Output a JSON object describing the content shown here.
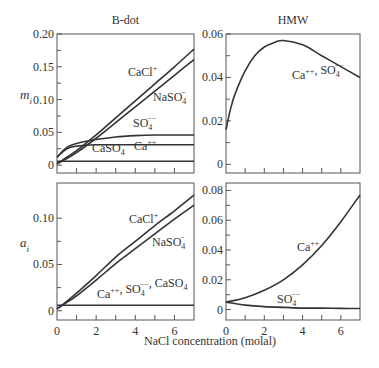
{
  "figure": {
    "column_titles": [
      "B-dot",
      "HMW"
    ],
    "row_ylabels": [
      "m_i",
      "a_i"
    ],
    "xlabel": "NaCl concentration (molal)"
  },
  "chart_data": [
    {
      "type": "line",
      "panel": "top-left",
      "title": "B-dot",
      "ylabel": "m_i",
      "xlabel": "",
      "xlim": [
        0,
        7
      ],
      "ylim": [
        -0.012,
        0.2
      ],
      "yticks": [
        0,
        0.05,
        0.1,
        0.15,
        0.2
      ],
      "ytick_labels": [
        "0",
        "0.05",
        "0.10",
        "0.15",
        "0.20"
      ],
      "x": [
        0,
        0.5,
        1,
        2,
        3,
        4,
        5,
        6,
        7
      ],
      "series": [
        {
          "name": "CaCl+",
          "values": [
            0.002,
            0.012,
            0.022,
            0.046,
            0.072,
            0.098,
            0.124,
            0.15,
            0.177
          ]
        },
        {
          "name": "NaSO4-",
          "values": [
            0.002,
            0.01,
            0.019,
            0.041,
            0.065,
            0.089,
            0.113,
            0.137,
            0.161
          ]
        },
        {
          "name": "SO4--",
          "values": [
            0.012,
            0.027,
            0.033,
            0.039,
            0.043,
            0.045,
            0.046,
            0.046,
            0.046
          ]
        },
        {
          "name": "Ca++",
          "values": [
            0.012,
            0.025,
            0.029,
            0.031,
            0.031,
            0.031,
            0.031,
            0.031,
            0.031
          ]
        },
        {
          "name": "CaSO4",
          "values": [
            0.006,
            0.006,
            0.006,
            0.006,
            0.006,
            0.006,
            0.006,
            0.006,
            0.006
          ]
        }
      ],
      "annotations": [
        "CaCl+",
        "NaSO4-",
        "SO4--",
        "CaSO4",
        "Ca++"
      ]
    },
    {
      "type": "line",
      "panel": "top-right",
      "title": "HMW",
      "ylabel": "",
      "xlim": [
        0,
        7
      ],
      "ylim": [
        -0.004,
        0.06
      ],
      "yticks": [
        0,
        0.02,
        0.04,
        0.06
      ],
      "ytick_labels": [
        "0",
        "0.02",
        "0.04",
        "0.06"
      ],
      "x": [
        0,
        0.25,
        0.5,
        1,
        1.5,
        2,
        2.5,
        3,
        4,
        5,
        6,
        7
      ],
      "series": [
        {
          "name": "Ca++, SO4--",
          "values": [
            0.016,
            0.026,
            0.033,
            0.043,
            0.05,
            0.054,
            0.056,
            0.057,
            0.055,
            0.05,
            0.045,
            0.04
          ]
        }
      ],
      "annotations": [
        "Ca++, SO4--"
      ]
    },
    {
      "type": "line",
      "panel": "bottom-left",
      "title": "",
      "ylabel": "a_i",
      "xlabel": "NaCl concentration (molal)",
      "xlim": [
        0,
        7
      ],
      "ylim": [
        -0.01,
        0.138
      ],
      "yticks": [
        0,
        0.05,
        0.1
      ],
      "ytick_labels": [
        "0",
        "0.05",
        "0.10"
      ],
      "xticks": [
        0,
        2,
        4,
        6
      ],
      "x": [
        0,
        0.5,
        1,
        2,
        3,
        4,
        5,
        6,
        7
      ],
      "series": [
        {
          "name": "CaCl+",
          "values": [
            0.002,
            0.01,
            0.019,
            0.038,
            0.058,
            0.075,
            0.092,
            0.108,
            0.125
          ]
        },
        {
          "name": "NaSO4-",
          "values": [
            0.002,
            0.009,
            0.016,
            0.033,
            0.051,
            0.067,
            0.083,
            0.099,
            0.114
          ]
        },
        {
          "name": "Ca++, SO4--, CaSO4",
          "values": [
            0.006,
            0.006,
            0.006,
            0.006,
            0.006,
            0.006,
            0.006,
            0.006,
            0.006
          ]
        }
      ],
      "annotations": [
        "CaCl+",
        "NaSO4-",
        "Ca++, SO4--, CaSO4"
      ]
    },
    {
      "type": "line",
      "panel": "bottom-right",
      "title": "",
      "ylabel": "",
      "xlim": [
        0,
        7
      ],
      "ylim": [
        -0.007,
        0.085
      ],
      "yticks": [
        0,
        0.02,
        0.04,
        0.06,
        0.08
      ],
      "ytick_labels": [
        "0",
        "0.02",
        "0.04",
        "0.06",
        "0.08"
      ],
      "xticks": [
        0,
        2,
        4,
        6
      ],
      "x": [
        0,
        1,
        2,
        3,
        4,
        5,
        6,
        7
      ],
      "series": [
        {
          "name": "Ca++",
          "values": [
            0.005,
            0.008,
            0.013,
            0.02,
            0.03,
            0.043,
            0.059,
            0.077
          ]
        },
        {
          "name": "SO4--",
          "values": [
            0.005,
            0.003,
            0.002,
            0.0015,
            0.001,
            0.001,
            0.0008,
            0.0007
          ]
        }
      ],
      "annotations": [
        "Ca++",
        "SO4--"
      ]
    }
  ]
}
